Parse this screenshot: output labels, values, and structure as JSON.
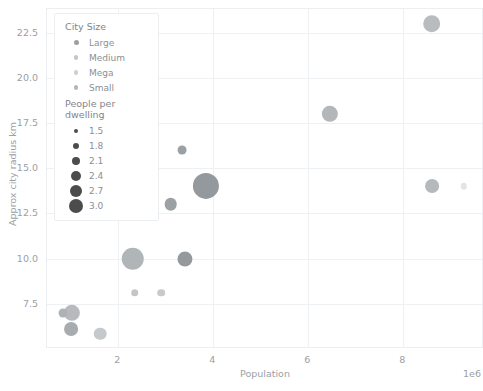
{
  "chart_data": {
    "type": "scatter",
    "title": "",
    "xlabel": "Population",
    "ylabel": "Approx city radius km",
    "x_exponent_label": "1e6",
    "xlim": [
      500000,
      9700000
    ],
    "ylim": [
      5.0,
      23.8
    ],
    "xticks": [
      2,
      4,
      6,
      8
    ],
    "xtick_labels": [
      "2",
      "4",
      "6",
      "8"
    ],
    "yticks": [
      7.5,
      10.0,
      12.5,
      15.0,
      17.5,
      20.0,
      22.5
    ],
    "ytick_labels": [
      "7.5",
      "10.0",
      "12.5",
      "15.0",
      "17.5",
      "20.0",
      "22.5"
    ],
    "grid": true,
    "legend_position": "upper left",
    "size_encoding": "People per dwelling",
    "hue_encoding": "City Size",
    "points": [
      {
        "x": 8600000,
        "y": 23.0,
        "size": 2.3,
        "city_size": "Mega",
        "color": "#b9bcbe"
      },
      {
        "x": 6450000,
        "y": 18.0,
        "size": 2.2,
        "city_size": "Mega",
        "color": "#b3b7b9"
      },
      {
        "x": 3350000,
        "y": 16.0,
        "size": 1.6,
        "city_size": "Large",
        "color": "#9aa0a3"
      },
      {
        "x": 3850000,
        "y": 14.0,
        "size": 3.0,
        "city_size": "Large",
        "color": "#93999c"
      },
      {
        "x": 8600000,
        "y": 14.0,
        "size": 2.0,
        "city_size": "Medium",
        "color": "#b5b9bb"
      },
      {
        "x": 9280000,
        "y": 14.0,
        "size": 1.4,
        "city_size": "Medium",
        "color": "#e2e4e5"
      },
      {
        "x": 2550000,
        "y": 13.1,
        "size": 1.8,
        "city_size": "Medium",
        "color": "#b0b4b7"
      },
      {
        "x": 3100000,
        "y": 13.0,
        "size": 1.9,
        "city_size": "Large",
        "color": "#9ca1a4"
      },
      {
        "x": 2300000,
        "y": 10.0,
        "size": 2.7,
        "city_size": "Medium",
        "color": "#b0b5b8"
      },
      {
        "x": 3400000,
        "y": 10.0,
        "size": 2.1,
        "city_size": "Large",
        "color": "#94999d"
      },
      {
        "x": 2350000,
        "y": 8.1,
        "size": 1.5,
        "city_size": "Medium",
        "color": "#c2c6c8"
      },
      {
        "x": 2900000,
        "y": 8.1,
        "size": 1.5,
        "city_size": "Medium",
        "color": "#c6cacc"
      },
      {
        "x": 1020000,
        "y": 7.0,
        "size": 2.2,
        "city_size": "Small",
        "color": "#b6babd"
      },
      {
        "x": 830000,
        "y": 7.0,
        "size": 1.6,
        "city_size": "Small",
        "color": "#aeb2b5"
      },
      {
        "x": 1000000,
        "y": 6.1,
        "size": 2.0,
        "city_size": "Small",
        "color": "#a8acaf"
      },
      {
        "x": 1620000,
        "y": 5.85,
        "size": 1.9,
        "city_size": "Small",
        "color": "#c5c9cb"
      }
    ]
  },
  "legend": {
    "hue_title": "City Size",
    "hue_items": [
      {
        "label": "Large",
        "color": "#9aa0a3",
        "dot": 5.0
      },
      {
        "label": "Medium",
        "color": "#c3c7c9",
        "dot": 4.6
      },
      {
        "label": "Mega",
        "color": "#cdd0d2",
        "dot": 4.4
      },
      {
        "label": "Small",
        "color": "#b4b8bb",
        "dot": 4.8
      }
    ],
    "size_title": "People per dwelling",
    "size_items": [
      {
        "label": "1.5",
        "dot": 4.0
      },
      {
        "label": "1.8",
        "dot": 6.0
      },
      {
        "label": "2.1",
        "dot": 8.0
      },
      {
        "label": "2.4",
        "dot": 10.0
      },
      {
        "label": "2.7",
        "dot": 12.0
      },
      {
        "label": "3.0",
        "dot": 14.0
      }
    ],
    "size_dot_color": "#4c4c4c"
  }
}
